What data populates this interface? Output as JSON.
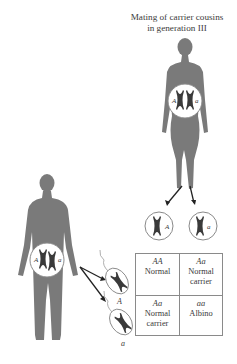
{
  "title": {
    "line1": "Mating of carrier cousins",
    "line2": "in generation III"
  },
  "figures": {
    "female": {
      "name": "female-silhouette",
      "alleles": [
        "A",
        "a"
      ]
    },
    "male": {
      "name": "male-silhouette",
      "alleles": [
        "A",
        "a"
      ]
    }
  },
  "gametes": {
    "egg_alleles": [
      "A",
      "a"
    ],
    "sperm_alleles": [
      "A",
      "a"
    ]
  },
  "punnett": {
    "cells": [
      {
        "genotype": "AA",
        "line1": "Normal",
        "line2": ""
      },
      {
        "genotype": "Aa",
        "line1": "Normal",
        "line2": "carrier"
      },
      {
        "genotype": "Aa",
        "line1": "Normal",
        "line2": "carrier"
      },
      {
        "genotype": "aa",
        "line1": "Albino",
        "line2": ""
      }
    ]
  },
  "colors": {
    "silhouette": "#7a7a7a",
    "chromosome": "#3a3a3a",
    "line": "#8a8a8a"
  }
}
